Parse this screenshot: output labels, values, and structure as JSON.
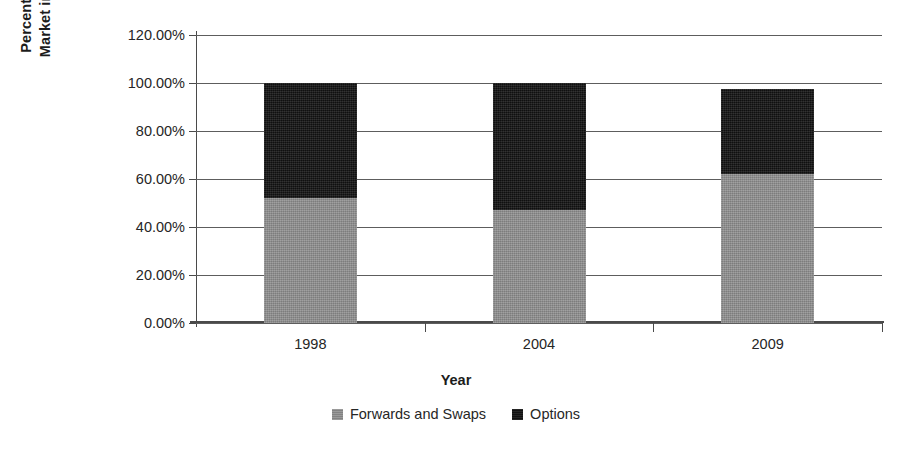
{
  "chart_data": {
    "type": "bar",
    "subtype": "stacked-bar",
    "title": "",
    "xlabel": "Year",
    "ylabel": "Percentage of Total Market in Given Year",
    "ylabel_lines": [
      "Percentage of Total",
      "Market in Given Year"
    ],
    "categories": [
      "1998",
      "2004",
      "2009"
    ],
    "series": [
      {
        "name": "Forwards and Swaps",
        "color": "#8c8c8c",
        "values": [
          52.0,
          47.0,
          62.0
        ]
      },
      {
        "name": "Options",
        "color": "#141414",
        "values": [
          48.0,
          53.0,
          35.5
        ]
      }
    ],
    "stack_totals": [
      100.0,
      100.0,
      97.5
    ],
    "ylim": [
      0,
      120
    ],
    "ytick_values": [
      0,
      20,
      40,
      60,
      80,
      100,
      120
    ],
    "ytick_labels": [
      "0.00%",
      "20.00%",
      "40.00%",
      "60.00%",
      "80.00%",
      "100.00%",
      "120.00%"
    ],
    "grid": "horizontal",
    "legend_position": "bottom",
    "legend_entries": [
      "Forwards and Swaps",
      "Options"
    ],
    "value_format": "percent"
  }
}
